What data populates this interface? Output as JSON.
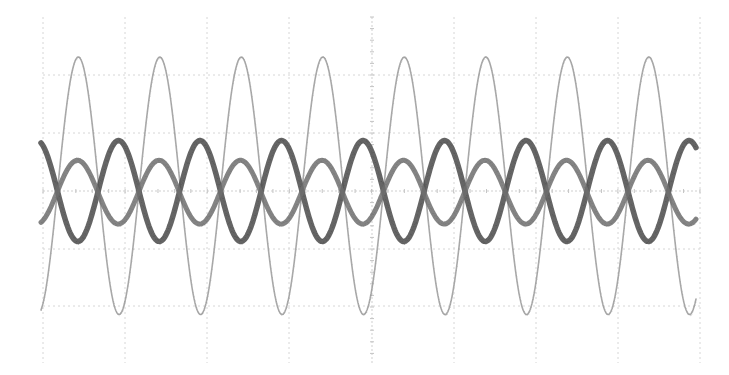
{
  "chart_data": {
    "type": "line",
    "title": "",
    "xlabel": "",
    "ylabel": "",
    "grid": true,
    "legend": "none",
    "x_divisions": 8,
    "y_divisions": 6,
    "xlim": [
      0,
      8
    ],
    "ylim": [
      -3,
      3
    ],
    "period_divisions": 1.0,
    "cycles_shown": 8,
    "series": [
      {
        "name": "trace-1-light",
        "color": "#9a9a9a",
        "amplitude_div": 2.22,
        "offset_div": 0.09,
        "phase_peak_x_div": 0.43,
        "noise_width": 1.8,
        "stroke_width": 1.6
      },
      {
        "name": "trace-2-dark",
        "color": "#4a4a4a",
        "amplitude_div": 0.87,
        "offset_div": 0.0,
        "phase_peak_x_div": 0.92,
        "noise_width": 5.5,
        "stroke_width": 5.5
      },
      {
        "name": "trace-3-medium",
        "color": "#6e6e6e",
        "amplitude_div": 0.55,
        "offset_div": -0.02,
        "phase_peak_x_div": 0.42,
        "noise_width": 5,
        "stroke_width": 5
      }
    ]
  },
  "plot_area": {
    "left": 43,
    "right": 700,
    "top": 17,
    "bottom": 363,
    "trace_start_x": 41,
    "trace_end_x": 696,
    "grid_x": [
      43,
      125,
      207,
      289,
      372,
      454,
      536,
      618,
      700
    ],
    "grid_y": [
      75,
      133,
      191,
      249,
      306
    ],
    "center_y": 191,
    "center_x": 372
  },
  "colors": {
    "background": "#ffffff",
    "grid": "#d6d6d6"
  }
}
